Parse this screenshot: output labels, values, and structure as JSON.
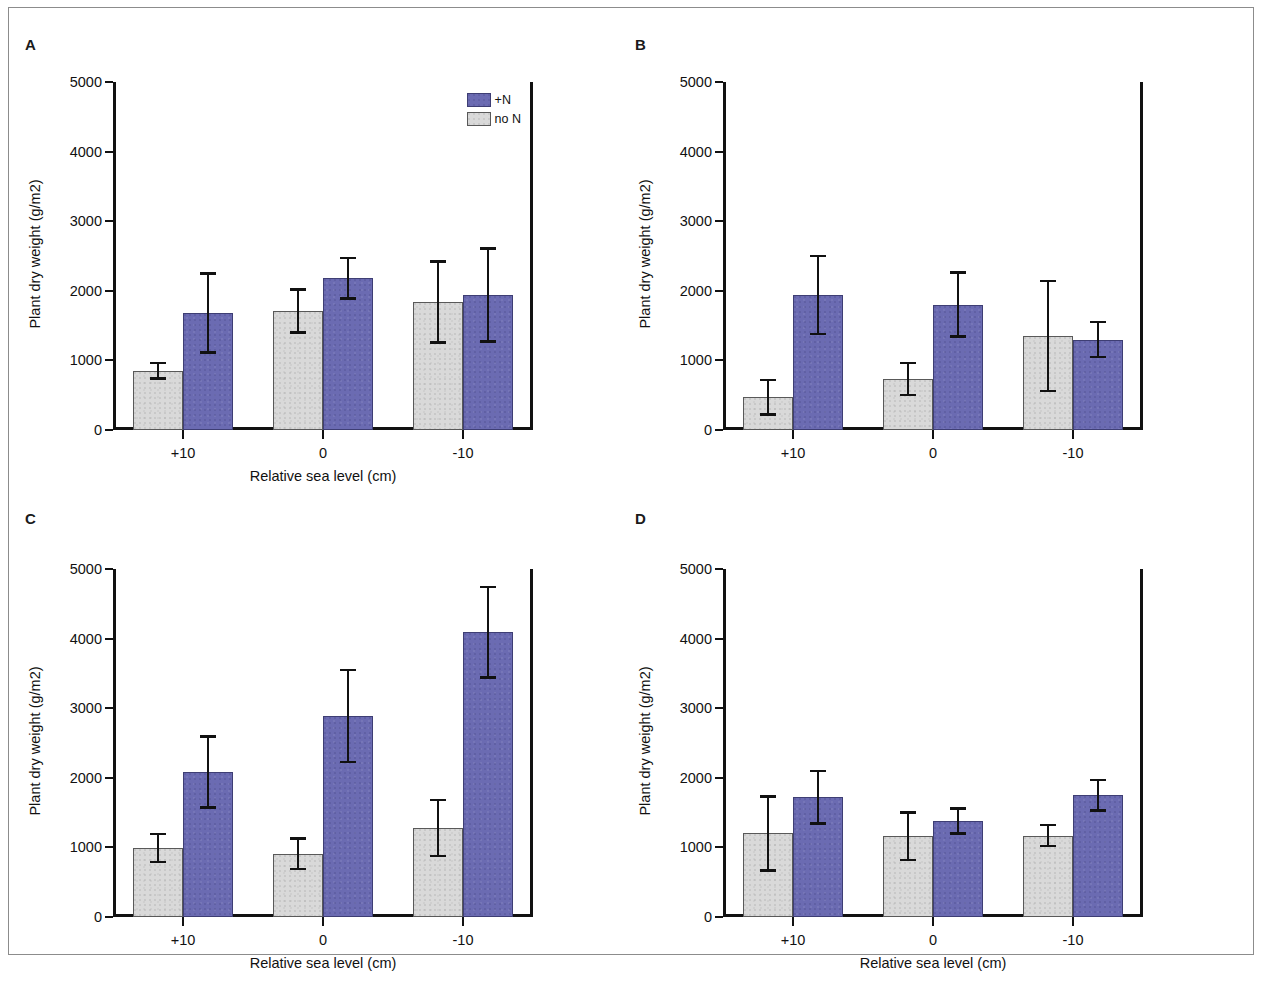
{
  "figure": {
    "panel_labels": [
      "A",
      "B",
      "C",
      "D"
    ],
    "legend": {
      "entries": [
        {
          "label": "+N",
          "color": "#6b6bb2",
          "key": "plus_n"
        },
        {
          "label": "no N",
          "color": "#d9d9d9",
          "key": "no_n"
        }
      ]
    },
    "axis": {
      "ylabel": "Plant dry weight (g/m2)",
      "xlabel": "Relative sea level (cm)",
      "yticks": [
        0,
        1000,
        2000,
        3000,
        4000,
        5000
      ],
      "ytick_labels": [
        "0",
        "1000",
        "2000",
        "3000",
        "4000",
        "5000"
      ],
      "xtick_labels": [
        "+10",
        "0",
        "-10"
      ]
    }
  },
  "chart_data": [
    {
      "type": "bar",
      "panel": "A",
      "title": "",
      "xlabel": "Relative sea level (cm)",
      "ylabel": "Plant dry weight (g/m2)",
      "categories": [
        "+10",
        "0",
        "-10"
      ],
      "ylim": [
        0,
        5000
      ],
      "yticks": [
        0,
        1000,
        2000,
        3000,
        4000,
        5000
      ],
      "grid": false,
      "legend_position": "top-right",
      "series": [
        {
          "name": "no N",
          "color": "#d9d9d9",
          "values": [
            850,
            1710,
            1840
          ],
          "errors": [
            110,
            310,
            580
          ]
        },
        {
          "name": "+N",
          "color": "#6b6bb2",
          "values": [
            1680,
            2180,
            1940
          ],
          "errors": [
            570,
            290,
            670
          ]
        }
      ]
    },
    {
      "type": "bar",
      "panel": "B",
      "title": "",
      "xlabel": "",
      "ylabel": "Plant dry weight (g/m2)",
      "categories": [
        "+10",
        "0",
        "-10"
      ],
      "ylim": [
        0,
        5000
      ],
      "yticks": [
        0,
        1000,
        2000,
        3000,
        4000,
        5000
      ],
      "grid": false,
      "legend_position": "none",
      "series": [
        {
          "name": "no N",
          "color": "#d9d9d9",
          "values": [
            470,
            730,
            1350
          ],
          "errors": [
            250,
            230,
            790
          ]
        },
        {
          "name": "+N",
          "color": "#6b6bb2",
          "values": [
            1940,
            1800,
            1300
          ],
          "errors": [
            560,
            460,
            250
          ]
        }
      ]
    },
    {
      "type": "bar",
      "panel": "C",
      "title": "",
      "xlabel": "Relative sea level (cm)",
      "ylabel": "Plant dry weight (g/m2)",
      "categories": [
        "+10",
        "0",
        "-10"
      ],
      "ylim": [
        0,
        5000
      ],
      "yticks": [
        0,
        1000,
        2000,
        3000,
        4000,
        5000
      ],
      "grid": false,
      "legend_position": "none",
      "series": [
        {
          "name": "no N",
          "color": "#d9d9d9",
          "values": [
            990,
            910,
            1280
          ],
          "errors": [
            200,
            220,
            400
          ]
        },
        {
          "name": "+N",
          "color": "#6b6bb2",
          "values": [
            2080,
            2890,
            4090
          ],
          "errors": [
            510,
            660,
            650
          ]
        }
      ]
    },
    {
      "type": "bar",
      "panel": "D",
      "title": "",
      "xlabel": "Relative sea level (cm)",
      "ylabel": "Plant dry weight (g/m2)",
      "categories": [
        "+10",
        "0",
        "-10"
      ],
      "ylim": [
        0,
        5000
      ],
      "yticks": [
        0,
        1000,
        2000,
        3000,
        4000,
        5000
      ],
      "grid": false,
      "legend_position": "none",
      "series": [
        {
          "name": "no N",
          "color": "#d9d9d9",
          "values": [
            1200,
            1160,
            1170
          ],
          "errors": [
            530,
            340,
            150
          ]
        },
        {
          "name": "+N",
          "color": "#6b6bb2",
          "values": [
            1720,
            1380,
            1750
          ],
          "errors": [
            380,
            180,
            220
          ]
        }
      ]
    }
  ]
}
